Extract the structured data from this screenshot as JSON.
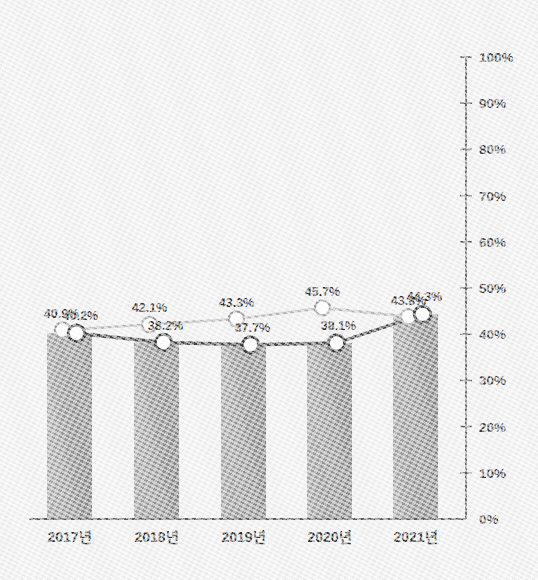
{
  "chart_data": {
    "type": "line",
    "title": "",
    "subtitle": "",
    "xlabel": "",
    "ylabel": "",
    "ylim": [
      0,
      100
    ],
    "y_unit": "%",
    "grid": false,
    "legend": "none",
    "axis": {
      "y_ticks": [
        "0%",
        "10%",
        "20%",
        "30%",
        "40%",
        "50%",
        "60%",
        "70%",
        "80%",
        "90%",
        "100%"
      ],
      "y_tick_values": [
        0,
        10,
        20,
        30,
        40,
        50,
        60,
        70,
        80,
        90,
        100
      ],
      "y_axis_position": "right"
    },
    "categories": [
      "2017년",
      "2018년",
      "2019년",
      "2020년",
      "2021년"
    ],
    "series": [
      {
        "name": "series-light",
        "style": "line-marker",
        "color": "#b9b9b9",
        "marker_fill": "#ffffff",
        "marker_stroke": "#9e9e9e",
        "values": [
          40.9,
          42.1,
          43.3,
          45.7,
          43.8
        ],
        "labels": [
          "40.9%",
          "42.1%",
          "43.3%",
          "45.7%",
          "43.8%"
        ]
      },
      {
        "name": "series-dark",
        "style": "line-marker",
        "color": "#4a4a4a",
        "marker_fill": "#ffffff",
        "marker_stroke": "#3a3a3a",
        "values": [
          40.2,
          38.2,
          37.7,
          38.1,
          44.3
        ],
        "labels": [
          "40.2%",
          "38.2%",
          "37.7%",
          "38.1%",
          "44.3%"
        ]
      },
      {
        "name": "series-bars",
        "style": "bar",
        "color_left": "#9b9b9b",
        "color_right": "#8d8d8d",
        "values": [
          40.2,
          38.2,
          37.7,
          38.1,
          44.3
        ]
      }
    ],
    "colors": {
      "background": "#f1f1f1",
      "axis": "#5d5d5d",
      "bar_gradient_start": "#a4a4a4",
      "bar_gradient_end": "#8a8a8a",
      "line_light": "#b9b9b9",
      "line_dark": "#474747",
      "text": "#2b2b2b"
    }
  }
}
